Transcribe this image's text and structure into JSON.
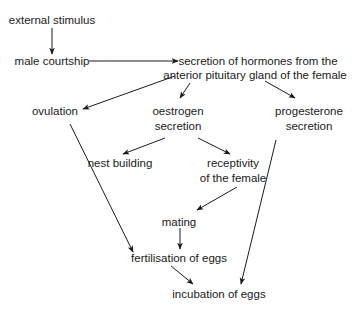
{
  "diagram": {
    "type": "flowchart",
    "nodes": {
      "external_stimulus": {
        "lines": [
          "external stimulus"
        ]
      },
      "male_courtship": {
        "lines": [
          "male courtship"
        ]
      },
      "hormone_secretion": {
        "lines": [
          "secretion of hormones from the",
          "anterior pituitary gland of the female"
        ]
      },
      "ovulation": {
        "lines": [
          "ovulation"
        ]
      },
      "oestrogen_secretion": {
        "lines": [
          "oestrogen",
          "secretion"
        ]
      },
      "progesterone_secretion": {
        "lines": [
          "progesterone",
          "secretion"
        ]
      },
      "nest_building": {
        "lines": [
          "nest building"
        ]
      },
      "receptivity": {
        "lines": [
          "receptivity",
          "of the female"
        ]
      },
      "mating": {
        "lines": [
          "mating"
        ]
      },
      "fertilisation": {
        "lines": [
          "fertilisation of eggs"
        ]
      },
      "incubation": {
        "lines": [
          "incubation of eggs"
        ]
      }
    },
    "edges": [
      {
        "from": "external_stimulus",
        "to": "male_courtship"
      },
      {
        "from": "male_courtship",
        "to": "hormone_secretion"
      },
      {
        "from": "hormone_secretion",
        "to": "ovulation"
      },
      {
        "from": "hormone_secretion",
        "to": "oestrogen_secretion"
      },
      {
        "from": "hormone_secretion",
        "to": "progesterone_secretion"
      },
      {
        "from": "oestrogen_secretion",
        "to": "nest_building"
      },
      {
        "from": "oestrogen_secretion",
        "to": "receptivity"
      },
      {
        "from": "receptivity",
        "to": "mating"
      },
      {
        "from": "mating",
        "to": "fertilisation"
      },
      {
        "from": "ovulation",
        "to": "fertilisation"
      },
      {
        "from": "fertilisation",
        "to": "incubation"
      },
      {
        "from": "progesterone_secretion",
        "to": "incubation"
      }
    ]
  }
}
